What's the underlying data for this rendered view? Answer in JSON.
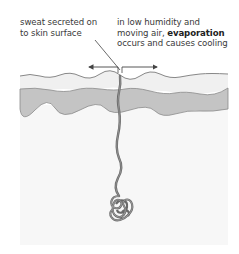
{
  "diagram": {
    "labels": {
      "left": {
        "line1": "sweat secreted on",
        "line2": "to skin surface"
      },
      "right": {
        "line1": "in low humidity and",
        "line2_prefix": "moving air, ",
        "line2_bold": "evaporation",
        "line3": "occurs and causes cooling"
      }
    },
    "structures": [
      {
        "name": "epidermis",
        "color": "#f0f0f0"
      },
      {
        "name": "dermis-band",
        "color": "#c4c4c4"
      },
      {
        "name": "subcutaneous-tissue",
        "color": "#f7f7f7"
      },
      {
        "name": "sweat-duct",
        "color": "#6a6a6a"
      },
      {
        "name": "sweat-gland-coil",
        "color": "#6a6a6a"
      }
    ],
    "arrows": [
      {
        "direction": "left",
        "meaning": "evaporation spreading"
      },
      {
        "direction": "right",
        "meaning": "evaporation spreading"
      }
    ],
    "colors": {
      "text": "#3a3a3a",
      "outline": "#7a7a7a",
      "arrow": "#444444"
    }
  }
}
